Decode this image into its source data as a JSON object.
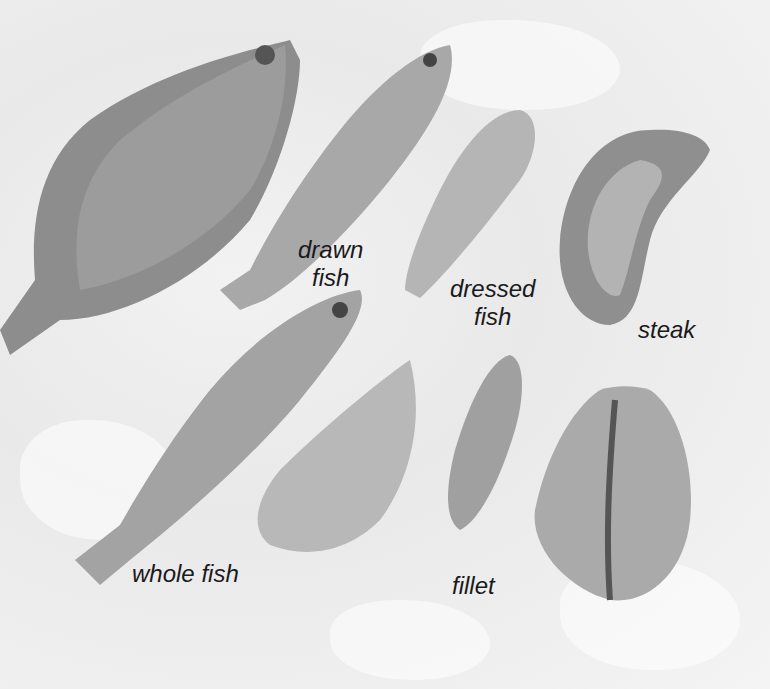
{
  "image": {
    "description": "Photo of fish market forms on crushed ice",
    "background_color": "#ececec"
  },
  "labels": {
    "drawn_fish": {
      "line1": "drawn",
      "line2": "fish"
    },
    "dressed_fish": {
      "line1": "dressed",
      "line2": "fish"
    },
    "steak": "steak",
    "whole_fish": "whole fish",
    "fillet": "fillet"
  }
}
